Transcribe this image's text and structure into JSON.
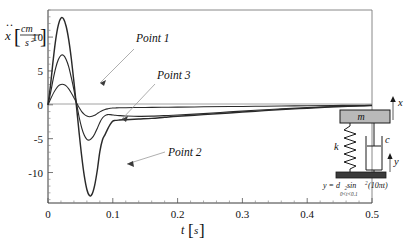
{
  "figure": {
    "kind": "engineering-plot-with-schematic"
  },
  "axes": {
    "ylabel_main": "x",
    "ylabel_accent": "¨",
    "ylabel_unit_num": "cm",
    "ylabel_unit_den": "s",
    "ylabel_unit_den_exp": "2",
    "xlabel_var": "t",
    "xlabel_unit": "s",
    "x_ticks": [
      "0",
      "0.1",
      "0.2",
      "0.3",
      "0.4",
      "0.5"
    ],
    "y_ticks": [
      "10",
      "5",
      "0",
      "-5",
      "-10"
    ]
  },
  "annotations": {
    "point1": "Point 1",
    "point2": "Point 2",
    "point3": "Point 3"
  },
  "schematic": {
    "mass_label": "m",
    "spring_label": "k",
    "damper_label": "c",
    "x_arrow_label": "x",
    "y_arrow_label": "y",
    "formula_lhs": "y = d",
    "formula_sub1": "2",
    "formula_sin": " sin",
    "formula_sin_exp": "2",
    "formula_arg": "(10πt)",
    "formula_condition": "0<t<0.1"
  },
  "colors": {
    "curve": "#2a2a2a",
    "frame": "#7b7b7b",
    "mass_fill": "#b9b9b9",
    "base_fill": "#3a3a3a",
    "leader": "#9a9a9a"
  },
  "chart_data": {
    "type": "line",
    "title": "",
    "xlabel": "t [s]",
    "ylabel": "ẍ [cm/s²]",
    "xlim": [
      0,
      0.5
    ],
    "ylim": [
      -14.5,
      14.0
    ],
    "grid": false,
    "legend_position": "inline-annotations",
    "xticks": [
      0,
      0.1,
      0.2,
      0.3,
      0.4,
      0.5
    ],
    "yticks": [
      10,
      5,
      0,
      -5,
      -10
    ],
    "series": [
      {
        "name": "Point 2",
        "annotation": "Point 2",
        "x": [
          0.0,
          0.004,
          0.008,
          0.012,
          0.016,
          0.02,
          0.024,
          0.028,
          0.032,
          0.036,
          0.04,
          0.044,
          0.048,
          0.052,
          0.056,
          0.06,
          0.064,
          0.068,
          0.072,
          0.076,
          0.08,
          0.084,
          0.088,
          0.092,
          0.096,
          0.1,
          0.104,
          0.11,
          0.12,
          0.14,
          0.16,
          0.18,
          0.2,
          0.24,
          0.28,
          0.32,
          0.36,
          0.4,
          0.44,
          0.48,
          0.5
        ],
        "y": [
          0.0,
          3.0,
          6.6,
          9.7,
          11.8,
          12.8,
          12.7,
          11.6,
          9.6,
          6.8,
          3.4,
          -0.3,
          -4.1,
          -7.6,
          -10.5,
          -12.5,
          -13.4,
          -13.2,
          -11.9,
          -9.7,
          -6.9,
          -5.2,
          -4.4,
          -3.6,
          -2.9,
          -2.4,
          -2.3,
          -2.25,
          -2.2,
          -2.1,
          -2.0,
          -1.85,
          -1.7,
          -1.45,
          -1.2,
          -0.95,
          -0.7,
          -0.5,
          -0.3,
          -0.15,
          -0.1
        ]
      },
      {
        "name": "Point 1",
        "annotation": "Point 1",
        "x": [
          0.0,
          0.004,
          0.008,
          0.012,
          0.016,
          0.02,
          0.024,
          0.028,
          0.032,
          0.036,
          0.04,
          0.044,
          0.048,
          0.052,
          0.056,
          0.06,
          0.064,
          0.068,
          0.072,
          0.076,
          0.08,
          0.084,
          0.088,
          0.092,
          0.096,
          0.1,
          0.104,
          0.11,
          0.12,
          0.14,
          0.16,
          0.18,
          0.2,
          0.24,
          0.28,
          0.32,
          0.36,
          0.4,
          0.44,
          0.48,
          0.5
        ],
        "y": [
          0.0,
          1.8,
          3.8,
          5.5,
          6.7,
          7.3,
          7.3,
          6.7,
          5.6,
          4.0,
          2.2,
          0.2,
          -1.8,
          -3.4,
          -4.5,
          -5.1,
          -5.2,
          -4.9,
          -4.3,
          -3.5,
          -2.6,
          -1.95,
          -1.6,
          -1.45,
          -1.45,
          -1.5,
          -1.55,
          -1.6,
          -1.65,
          -1.7,
          -1.68,
          -1.6,
          -1.5,
          -1.3,
          -1.05,
          -0.8,
          -0.6,
          -0.42,
          -0.28,
          -0.15,
          -0.1
        ]
      },
      {
        "name": "Point 3",
        "annotation": "Point 3",
        "x": [
          0.0,
          0.004,
          0.008,
          0.012,
          0.016,
          0.02,
          0.024,
          0.028,
          0.032,
          0.036,
          0.04,
          0.044,
          0.048,
          0.052,
          0.056,
          0.06,
          0.064,
          0.068,
          0.072,
          0.076,
          0.08,
          0.084,
          0.088,
          0.092,
          0.096,
          0.1,
          0.104,
          0.11,
          0.12,
          0.14,
          0.16,
          0.18,
          0.2,
          0.24,
          0.28,
          0.32,
          0.36,
          0.4,
          0.44,
          0.48,
          0.5
        ],
        "y": [
          0.0,
          0.85,
          1.65,
          2.3,
          2.8,
          3.0,
          3.0,
          2.8,
          2.35,
          1.75,
          1.05,
          0.3,
          -0.4,
          -1.0,
          -1.4,
          -1.65,
          -1.75,
          -1.7,
          -1.55,
          -1.3,
          -1.05,
          -0.85,
          -0.7,
          -0.6,
          -0.52,
          -0.48,
          -0.46,
          -0.44,
          -0.42,
          -0.4,
          -0.38,
          -0.36,
          -0.34,
          -0.3,
          -0.26,
          -0.22,
          -0.18,
          -0.14,
          -0.1,
          -0.06,
          -0.05
        ]
      }
    ]
  }
}
